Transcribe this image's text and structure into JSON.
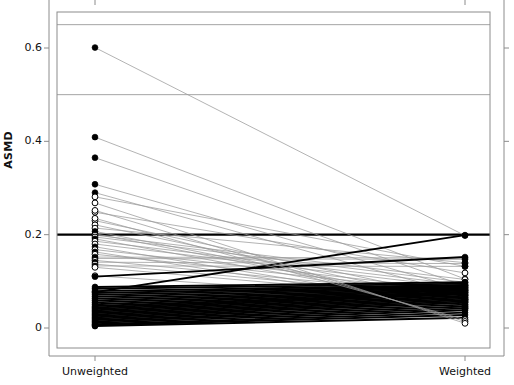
{
  "chart_data": {
    "type": "line",
    "title": "",
    "subtitle": "",
    "xlabel": "",
    "ylabel": "ASMD",
    "categories": [
      "Unweighted",
      "Weighted"
    ],
    "xtick_labels": [
      "Unweighted",
      "Weighted"
    ],
    "ytick_labels": [
      "0",
      "0.2",
      "0.4",
      "0.6"
    ],
    "ytick_values": [
      0,
      0.2,
      0.4,
      0.6
    ],
    "ylim": [
      -0.02,
      0.68
    ],
    "xlim": [
      0,
      1
    ],
    "grid": false,
    "legend": null,
    "legend_position": "none",
    "annotations": [],
    "reference_lines": [
      {
        "y": 0.65,
        "style": "thin-gray"
      },
      {
        "y": 0.5,
        "style": "thin-gray"
      },
      {
        "y": 0.2,
        "style": "bold-black"
      }
    ],
    "point_styles": {
      "filled": "solid black circle",
      "hollow": "open circle with black outline"
    },
    "line_styles": {
      "decrease": "thin gray line",
      "increase": "bold black line"
    },
    "series": [
      {
        "name": "var01",
        "marker": "filled",
        "values": [
          0.601,
          0.198
        ]
      },
      {
        "name": "var02",
        "marker": "filled",
        "values": [
          0.409,
          0.105
        ]
      },
      {
        "name": "var03",
        "marker": "filled",
        "values": [
          0.365,
          0.09
        ]
      },
      {
        "name": "var04",
        "marker": "filled",
        "values": [
          0.308,
          0.082
        ]
      },
      {
        "name": "var05",
        "marker": "filled",
        "values": [
          0.29,
          0.071
        ]
      },
      {
        "name": "var06",
        "marker": "hollow",
        "values": [
          0.281,
          0.132
        ]
      },
      {
        "name": "var07",
        "marker": "hollow",
        "values": [
          0.248,
          0.118
        ]
      },
      {
        "name": "var08",
        "marker": "hollow",
        "values": [
          0.23,
          0.062
        ]
      },
      {
        "name": "var09",
        "marker": "hollow",
        "values": [
          0.221,
          0.055
        ]
      },
      {
        "name": "var10",
        "marker": "hollow",
        "values": [
          0.214,
          0.14
        ]
      },
      {
        "name": "var11",
        "marker": "filled",
        "values": [
          0.207,
          0.051
        ]
      },
      {
        "name": "var12",
        "marker": "filled",
        "values": [
          0.202,
          0.048
        ]
      },
      {
        "name": "var13",
        "marker": "hollow",
        "values": [
          0.199,
          0.104
        ]
      },
      {
        "name": "var14",
        "marker": "hollow",
        "values": [
          0.195,
          0.098
        ]
      },
      {
        "name": "var15",
        "marker": "filled",
        "values": [
          0.191,
          0.045
        ]
      },
      {
        "name": "var16",
        "marker": "hollow",
        "values": [
          0.186,
          0.092
        ]
      },
      {
        "name": "var17",
        "marker": "hollow",
        "values": [
          0.18,
          0.086
        ]
      },
      {
        "name": "var18",
        "marker": "filled",
        "values": [
          0.174,
          0.043
        ]
      },
      {
        "name": "var19",
        "marker": "hollow",
        "values": [
          0.168,
          0.08
        ]
      },
      {
        "name": "var20",
        "marker": "filled",
        "values": [
          0.163,
          0.041
        ]
      },
      {
        "name": "var21",
        "marker": "hollow",
        "values": [
          0.158,
          0.076
        ]
      },
      {
        "name": "var22",
        "marker": "filled",
        "values": [
          0.152,
          0.15
        ]
      },
      {
        "name": "var23",
        "marker": "filled",
        "values": [
          0.149,
          0.147
        ]
      },
      {
        "name": "var24",
        "marker": "hollow",
        "values": [
          0.145,
          0.07
        ]
      },
      {
        "name": "var25",
        "marker": "filled",
        "values": [
          0.141,
          0.138
        ]
      },
      {
        "name": "var26",
        "marker": "hollow",
        "values": [
          0.137,
          0.066
        ]
      },
      {
        "name": "var27",
        "marker": "filled",
        "values": [
          0.133,
          0.132
        ]
      },
      {
        "name": "var28",
        "marker": "hollow",
        "values": [
          0.13,
          0.061
        ]
      },
      {
        "name": "var29",
        "marker": "hollow",
        "values": [
          0.112,
          0.058
        ]
      },
      {
        "name": "var30",
        "marker": "filled",
        "values": [
          0.088,
          0.098
        ]
      },
      {
        "name": "var31",
        "marker": "filled",
        "values": [
          0.084,
          0.095
        ]
      },
      {
        "name": "var32",
        "marker": "filled",
        "values": [
          0.079,
          0.092
        ]
      },
      {
        "name": "var33",
        "marker": "filled",
        "values": [
          0.075,
          0.09
        ]
      },
      {
        "name": "var34",
        "marker": "filled",
        "values": [
          0.071,
          0.088
        ]
      },
      {
        "name": "var35",
        "marker": "filled",
        "values": [
          0.067,
          0.086
        ]
      },
      {
        "name": "var36",
        "marker": "filled",
        "values": [
          0.063,
          0.084
        ]
      },
      {
        "name": "var37",
        "marker": "filled",
        "values": [
          0.059,
          0.082
        ]
      },
      {
        "name": "var38",
        "marker": "filled",
        "values": [
          0.055,
          0.08
        ]
      },
      {
        "name": "var39",
        "marker": "filled",
        "values": [
          0.051,
          0.078
        ]
      },
      {
        "name": "var40",
        "marker": "filled",
        "values": [
          0.047,
          0.076
        ]
      },
      {
        "name": "var41",
        "marker": "filled",
        "values": [
          0.044,
          0.074
        ]
      },
      {
        "name": "var42",
        "marker": "filled",
        "values": [
          0.041,
          0.072
        ]
      },
      {
        "name": "var43",
        "marker": "filled",
        "values": [
          0.038,
          0.069
        ]
      },
      {
        "name": "var44",
        "marker": "filled",
        "values": [
          0.035,
          0.066
        ]
      },
      {
        "name": "var45",
        "marker": "filled",
        "values": [
          0.032,
          0.063
        ]
      },
      {
        "name": "var46",
        "marker": "filled",
        "values": [
          0.029,
          0.06
        ]
      },
      {
        "name": "var47",
        "marker": "filled",
        "values": [
          0.026,
          0.057
        ]
      },
      {
        "name": "var48",
        "marker": "filled",
        "values": [
          0.023,
          0.054
        ]
      },
      {
        "name": "var49",
        "marker": "filled",
        "values": [
          0.02,
          0.05
        ]
      },
      {
        "name": "var50",
        "marker": "filled",
        "values": [
          0.017,
          0.046
        ]
      },
      {
        "name": "var51",
        "marker": "filled",
        "values": [
          0.014,
          0.042
        ]
      },
      {
        "name": "var52",
        "marker": "filled",
        "values": [
          0.011,
          0.038
        ]
      },
      {
        "name": "var53",
        "marker": "filled",
        "values": [
          0.008,
          0.033
        ]
      },
      {
        "name": "var54",
        "marker": "filled",
        "values": [
          0.006,
          0.028
        ]
      },
      {
        "name": "var55",
        "marker": "filled",
        "values": [
          0.004,
          0.022
        ]
      },
      {
        "name": "var56",
        "marker": "filled",
        "values": [
          0.077,
          0.199
        ]
      },
      {
        "name": "var57",
        "marker": "filled",
        "values": [
          0.11,
          0.152
        ]
      },
      {
        "name": "var58",
        "marker": "hollow",
        "values": [
          0.235,
          0.018
        ]
      },
      {
        "name": "var59",
        "marker": "hollow",
        "values": [
          0.252,
          0.014
        ]
      },
      {
        "name": "var60",
        "marker": "hollow",
        "values": [
          0.268,
          0.01
        ]
      }
    ],
    "colors": {
      "line_decrease": "#9a9a9a",
      "line_increase": "#000000",
      "marker_fill": "#000000",
      "marker_open": "#ffffff",
      "marker_stroke": "#000000",
      "axis": "#8c8c8c",
      "reference_bold": "#000000",
      "reference_thin": "#9a9a9a"
    }
  },
  "axis": {
    "ylabel": "ASMD",
    "ytick_0": "0",
    "ytick_1": "0.2",
    "ytick_2": "0.4",
    "ytick_3": "0.6",
    "xtick_left": "Unweighted",
    "xtick_right": "Weighted"
  }
}
